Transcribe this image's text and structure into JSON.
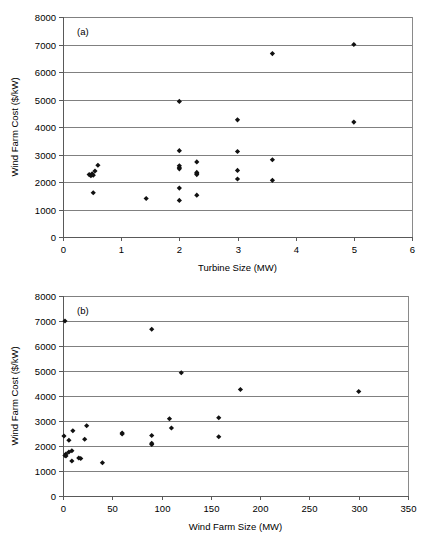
{
  "figure": {
    "panel_a_label": "(a)",
    "panel_b_label": "(b)"
  },
  "chart_data": [
    {
      "type": "scatter",
      "panel": "(a)",
      "title": "",
      "xlabel": "Turbine Size (MW)",
      "ylabel": "Wind Farm Cost ($/kW)",
      "xlim": [
        0,
        6
      ],
      "ylim": [
        0,
        8000
      ],
      "xticks": [
        0,
        1,
        2,
        3,
        4,
        5,
        6
      ],
      "xtick_labels": [
        "0",
        "1",
        "2",
        "3",
        "4",
        "5",
        "6"
      ],
      "yticks": [
        0,
        1000,
        2000,
        3000,
        4000,
        5000,
        6000,
        7000,
        8000
      ],
      "ytick_labels": [
        "0",
        "1000",
        "2000",
        "3000",
        "4000",
        "5000",
        "6000",
        "7000",
        "8000"
      ],
      "grid": "horizontal",
      "legend": "none",
      "marker": "diamond",
      "marker_color": "#111111",
      "points": [
        {
          "x": 0.45,
          "y": 2270
        },
        {
          "x": 0.48,
          "y": 2230
        },
        {
          "x": 0.5,
          "y": 2300
        },
        {
          "x": 0.52,
          "y": 2250
        },
        {
          "x": 0.55,
          "y": 2400
        },
        {
          "x": 0.6,
          "y": 2610
        },
        {
          "x": 0.52,
          "y": 1610
        },
        {
          "x": 1.43,
          "y": 1400
        },
        {
          "x": 2.0,
          "y": 4930
        },
        {
          "x": 2.0,
          "y": 3140
        },
        {
          "x": 2.0,
          "y": 2590
        },
        {
          "x": 2.0,
          "y": 2520
        },
        {
          "x": 2.0,
          "y": 2480
        },
        {
          "x": 2.0,
          "y": 1780
        },
        {
          "x": 2.0,
          "y": 1330
        },
        {
          "x": 2.3,
          "y": 2730
        },
        {
          "x": 2.3,
          "y": 2350
        },
        {
          "x": 2.3,
          "y": 2300
        },
        {
          "x": 2.3,
          "y": 2270
        },
        {
          "x": 2.3,
          "y": 1520
        },
        {
          "x": 3.0,
          "y": 4260
        },
        {
          "x": 3.0,
          "y": 3110
        },
        {
          "x": 3.0,
          "y": 2420
        },
        {
          "x": 3.0,
          "y": 2110
        },
        {
          "x": 3.6,
          "y": 6670
        },
        {
          "x": 3.6,
          "y": 2810
        },
        {
          "x": 3.6,
          "y": 2060
        },
        {
          "x": 5.0,
          "y": 7000
        },
        {
          "x": 5.0,
          "y": 4180
        }
      ]
    },
    {
      "type": "scatter",
      "panel": "(b)",
      "title": "",
      "xlabel": "Wind Farm Size (MW)",
      "ylabel": "Wind Farm Cost ($/kW)",
      "xlim": [
        0,
        350
      ],
      "ylim": [
        0,
        8000
      ],
      "xticks": [
        0,
        50,
        100,
        150,
        200,
        250,
        300,
        350
      ],
      "xtick_labels": [
        "0",
        "50",
        "100",
        "150",
        "200",
        "250",
        "300",
        "350"
      ],
      "yticks": [
        0,
        1000,
        2000,
        3000,
        4000,
        5000,
        6000,
        7000,
        8000
      ],
      "ytick_labels": [
        "0",
        "1000",
        "2000",
        "3000",
        "4000",
        "5000",
        "6000",
        "7000",
        "8000"
      ],
      "grid": "horizontal",
      "legend": "none",
      "marker": "diamond",
      "marker_color": "#111111",
      "points": [
        {
          "x": 2,
          "y": 7000
        },
        {
          "x": 90,
          "y": 6670
        },
        {
          "x": 120,
          "y": 4930
        },
        {
          "x": 180,
          "y": 4260
        },
        {
          "x": 300,
          "y": 4180
        },
        {
          "x": 108,
          "y": 3090
        },
        {
          "x": 158,
          "y": 3130
        },
        {
          "x": 24,
          "y": 2810
        },
        {
          "x": 110,
          "y": 2720
        },
        {
          "x": 10,
          "y": 2610
        },
        {
          "x": 60,
          "y": 2520
        },
        {
          "x": 60,
          "y": 2480
        },
        {
          "x": 90,
          "y": 2420
        },
        {
          "x": 1,
          "y": 2400
        },
        {
          "x": 158,
          "y": 2370
        },
        {
          "x": 22,
          "y": 2270
        },
        {
          "x": 6,
          "y": 2230
        },
        {
          "x": 90,
          "y": 2110
        },
        {
          "x": 90,
          "y": 2060
        },
        {
          "x": 9,
          "y": 1810
        },
        {
          "x": 6,
          "y": 1760
        },
        {
          "x": 3,
          "y": 1680
        },
        {
          "x": 2,
          "y": 1620
        },
        {
          "x": 3,
          "y": 1600
        },
        {
          "x": 16,
          "y": 1520
        },
        {
          "x": 18,
          "y": 1500
        },
        {
          "x": 9,
          "y": 1400
        },
        {
          "x": 40,
          "y": 1330
        }
      ]
    }
  ]
}
